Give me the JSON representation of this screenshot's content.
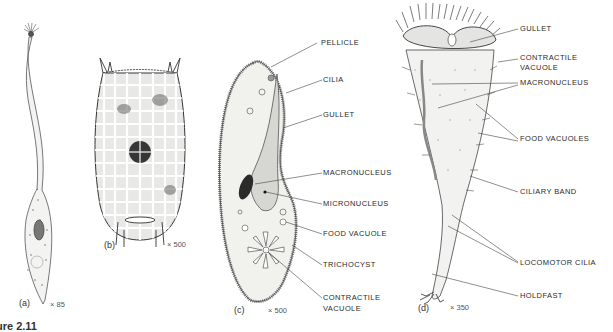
{
  "figure": {
    "caption_fragment": "ure 2.11",
    "panels": [
      {
        "id": "a",
        "tag": "(a)",
        "magnification": "× 85",
        "organism": "elongated ciliate with long neck"
      },
      {
        "id": "b",
        "tag": "(b)",
        "magnification": "× 500",
        "organism": "lorica-bearing ciliate (Coleps-like)"
      },
      {
        "id": "c",
        "tag": "(c)",
        "magnification": "× 500",
        "organism": "Paramecium"
      },
      {
        "id": "d",
        "tag": "(d)",
        "magnification": "× 350",
        "organism": "Vorticella-like ciliate"
      }
    ],
    "labels_c": [
      "PELLICLE",
      "CILIA",
      "GULLET",
      "MACRONUCLEUS",
      "MICRONUCLEUS",
      "FOOD VACUOLE",
      "TRICHOCYST",
      "CONTRACTILE",
      "VACUOLE"
    ],
    "labels_d": [
      "GULLET",
      "CONTRACTILE",
      "VACUOLE",
      "MACRONUCLEUS",
      "FOOD VACUOLES",
      "CILIARY BAND",
      "LOCOMOTOR CILIA",
      "HOLDFAST"
    ]
  },
  "colors": {
    "ink": "#2a2a2a",
    "body_fill": "#f2f2f0",
    "gullet_fill": "#d9d9d6",
    "nucleus": "#333333"
  }
}
